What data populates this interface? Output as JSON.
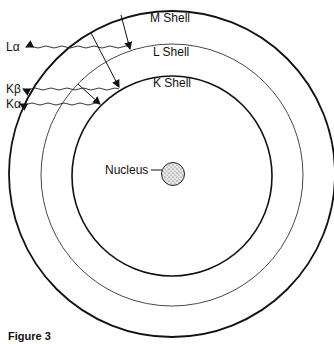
{
  "diagram": {
    "shells": [
      {
        "id": "M",
        "label": "M Shell",
        "radius": 164
      },
      {
        "id": "L",
        "label": "L Shell",
        "radius": 132
      },
      {
        "id": "K",
        "label": "K Shell",
        "radius": 100
      }
    ],
    "nucleus": {
      "label": "Nucleus"
    },
    "transitions": [
      {
        "from": "M",
        "to": "L",
        "emission": "Lα"
      },
      {
        "from": "M",
        "to": "K",
        "emission": "Kβ"
      },
      {
        "from": "L",
        "to": "K",
        "emission": "Kα"
      }
    ],
    "emission_labels": {
      "l_alpha": "Lα",
      "k_beta": "Kβ",
      "k_alpha": "Kα"
    },
    "shell_labels": {
      "m": "M Shell",
      "l": "L Shell",
      "k": "K Shell"
    },
    "nucleus_label": "Nucleus",
    "colors": {
      "line": "#111111",
      "background": "#ffffff",
      "nucleus_fill": "#bdbdbd"
    }
  },
  "caption": "Figure 3"
}
